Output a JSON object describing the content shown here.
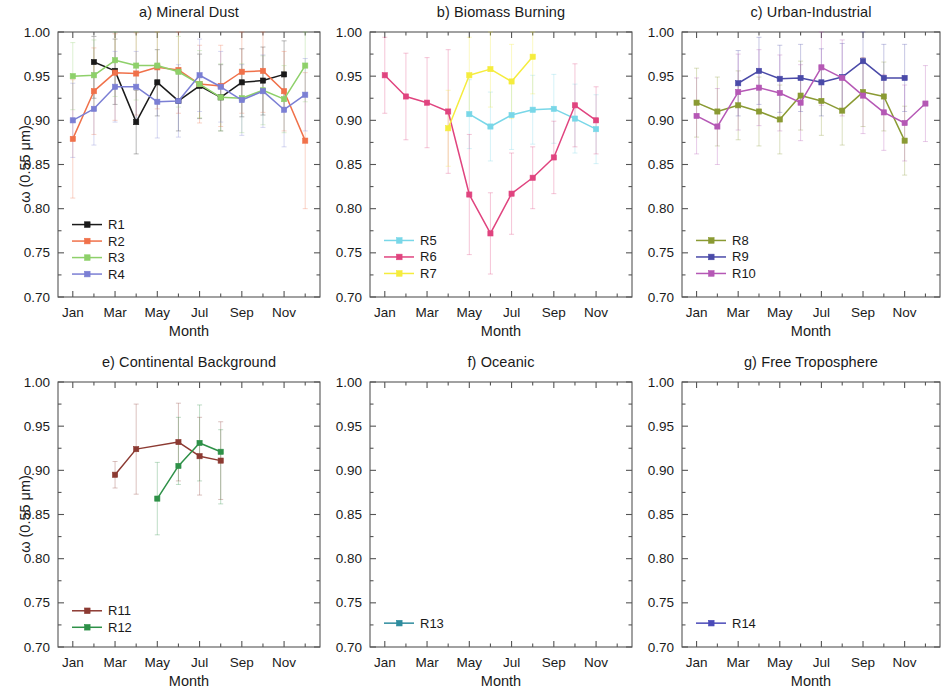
{
  "figure": {
    "width": 946,
    "height": 695,
    "background": "#ffffff"
  },
  "axis": {
    "ylabel": "ω (0.55 μm)",
    "xlabel": "Month",
    "ytick_labels": [
      "1.00",
      "0.95",
      "0.90",
      "0.85",
      "0.80",
      "0.75",
      "0.70"
    ],
    "ytick_values": [
      1.0,
      0.95,
      0.9,
      0.85,
      0.8,
      0.75,
      0.7
    ],
    "xtick_labels": [
      "Jan",
      "Mar",
      "May",
      "Jul",
      "Sep",
      "Nov"
    ],
    "xtick_values": [
      1,
      3,
      5,
      7,
      9,
      11
    ],
    "ylim": [
      0.7,
      1.0
    ],
    "xlim": [
      0.3,
      12.7
    ],
    "minor_ticks": true,
    "grid": false
  },
  "colors": {
    "R1": "#1a1a1a",
    "R2": "#f0714a",
    "R3": "#8ed06a",
    "R4": "#7b7fd4",
    "R5": "#79d7e8",
    "R6": "#e0447f",
    "R7": "#f5ec3d",
    "R8": "#8a9a33",
    "R9": "#4a4aa8",
    "R10": "#b558b5",
    "R11": "#8c3a32",
    "R12": "#2e9148",
    "R13": "#2e8c9e",
    "R14": "#4a4ab8",
    "frame": "#555555",
    "errorbar_opacity": "0.30"
  },
  "chart_data": [
    {
      "id": "a",
      "type": "line",
      "title": "a)  Mineral Dust",
      "xlabel": "Month",
      "ylabel": "ω (0.55 μm)",
      "ylim": [
        0.7,
        1.0
      ],
      "xlim": [
        0.3,
        12.7
      ],
      "categories": [
        "Jan",
        "Mar",
        "May",
        "Jul",
        "Sep",
        "Nov"
      ],
      "legend_position": "lower-left",
      "series": [
        {
          "name": "R1",
          "color": "#1a1a1a",
          "x": [
            2,
            3,
            4,
            5,
            6,
            7,
            8,
            9,
            10,
            11
          ],
          "values": [
            0.966,
            0.956,
            0.898,
            0.943,
            0.922,
            0.939,
            0.926,
            0.943,
            0.945,
            0.952
          ],
          "err_low": [
            0.925,
            0.918,
            0.862,
            0.905,
            0.888,
            0.902,
            0.888,
            0.904,
            0.906,
            0.914
          ],
          "err_high": [
            0.995,
            0.992,
            0.934,
            0.98,
            0.957,
            0.975,
            0.963,
            0.981,
            0.983,
            0.99
          ]
        },
        {
          "name": "R2",
          "color": "#f0714a",
          "x": [
            1,
            2,
            3,
            4,
            5,
            6,
            7,
            8,
            9,
            10,
            11,
            12
          ],
          "values": [
            0.879,
            0.933,
            0.954,
            0.953,
            0.96,
            0.957,
            0.941,
            0.939,
            0.955,
            0.956,
            0.933,
            0.877
          ],
          "err_low": [
            0.812,
            0.884,
            0.9,
            0.906,
            0.913,
            0.908,
            0.897,
            0.893,
            0.908,
            0.909,
            0.888,
            0.8
          ],
          "err_high": [
            0.946,
            0.982,
            0.998,
            0.999,
            1.0,
            1.0,
            0.985,
            0.985,
            1.0,
            1.0,
            0.978,
            0.954
          ]
        },
        {
          "name": "R3",
          "color": "#8ed06a",
          "x": [
            1,
            2,
            3,
            4,
            5,
            6,
            7,
            8,
            9,
            10,
            11,
            12
          ],
          "values": [
            0.95,
            0.951,
            0.968,
            0.962,
            0.962,
            0.955,
            0.941,
            0.926,
            0.925,
            0.934,
            0.924,
            0.962
          ],
          "err_low": [
            0.912,
            0.911,
            0.927,
            0.923,
            0.923,
            0.915,
            0.903,
            0.888,
            0.886,
            0.895,
            0.886,
            0.921
          ],
          "err_high": [
            0.988,
            0.991,
            1.0,
            1.0,
            1.0,
            0.995,
            0.979,
            0.964,
            0.964,
            0.973,
            0.962,
            1.0
          ]
        },
        {
          "name": "R4",
          "color": "#7b7fd4",
          "x": [
            1,
            2,
            3,
            4,
            5,
            6,
            7,
            8,
            9,
            10,
            11,
            12
          ],
          "values": [
            0.9,
            0.913,
            0.938,
            0.938,
            0.921,
            0.922,
            0.951,
            0.938,
            0.923,
            0.933,
            0.912,
            0.929
          ],
          "err_low": [
            0.858,
            0.872,
            0.898,
            0.898,
            0.88,
            0.881,
            0.91,
            0.898,
            0.883,
            0.892,
            0.87,
            0.888
          ],
          "err_high": [
            0.942,
            0.954,
            0.978,
            0.978,
            0.962,
            0.963,
            0.992,
            0.978,
            0.963,
            0.974,
            0.954,
            0.97
          ]
        }
      ]
    },
    {
      "id": "b",
      "type": "line",
      "title": "b) Biomass Burning",
      "xlabel": "Month",
      "ylabel": "",
      "ylim": [
        0.7,
        1.0
      ],
      "xlim": [
        0.3,
        12.7
      ],
      "categories": [
        "Jan",
        "Mar",
        "May",
        "Jul",
        "Sep",
        "Nov"
      ],
      "legend_position": "lower-left",
      "series": [
        {
          "name": "R5",
          "color": "#79d7e8",
          "x": [
            5,
            6,
            7,
            8,
            9,
            10,
            11
          ],
          "values": [
            0.907,
            0.893,
            0.906,
            0.912,
            0.913,
            0.902,
            0.89
          ],
          "err_low": [
            0.868,
            0.854,
            0.867,
            0.873,
            0.874,
            0.863,
            0.851
          ],
          "err_high": [
            0.946,
            0.932,
            0.945,
            0.951,
            0.952,
            0.941,
            0.929
          ]
        },
        {
          "name": "R6",
          "color": "#e0447f",
          "x": [
            1,
            2,
            3,
            4,
            5,
            6,
            7,
            8,
            9,
            10,
            11
          ],
          "values": [
            0.951,
            0.927,
            0.92,
            0.91,
            0.816,
            0.772,
            0.817,
            0.835,
            0.858,
            0.917,
            0.9
          ],
          "err_low": [
            0.908,
            0.878,
            0.869,
            0.84,
            0.748,
            0.726,
            0.771,
            0.8,
            0.817,
            0.87,
            0.862
          ],
          "err_high": [
            0.994,
            0.976,
            0.971,
            0.98,
            0.884,
            0.818,
            0.863,
            0.87,
            0.899,
            0.964,
            0.938
          ]
        },
        {
          "name": "R7",
          "color": "#f5ec3d",
          "x": [
            4,
            5,
            6,
            7,
            8
          ],
          "values": [
            0.891,
            0.951,
            0.958,
            0.944,
            0.972
          ],
          "err_low": [
            0.848,
            0.908,
            0.915,
            0.902,
            0.93
          ],
          "err_high": [
            0.934,
            0.994,
            1.0,
            0.986,
            1.0
          ]
        }
      ]
    },
    {
      "id": "c",
      "type": "line",
      "title": "c) Urban-Industrial",
      "xlabel": "Month",
      "ylabel": "",
      "ylim": [
        0.7,
        1.0
      ],
      "xlim": [
        0.3,
        12.7
      ],
      "categories": [
        "Jan",
        "Mar",
        "May",
        "Jul",
        "Sep",
        "Nov"
      ],
      "legend_position": "lower-left",
      "series": [
        {
          "name": "R8",
          "color": "#8a9a33",
          "x": [
            1,
            2,
            3,
            4,
            5,
            6,
            7,
            8,
            9,
            10,
            11
          ],
          "values": [
            0.92,
            0.91,
            0.917,
            0.91,
            0.901,
            0.928,
            0.922,
            0.911,
            0.932,
            0.927,
            0.877
          ],
          "err_low": [
            0.881,
            0.871,
            0.878,
            0.871,
            0.862,
            0.889,
            0.883,
            0.872,
            0.893,
            0.888,
            0.838
          ],
          "err_high": [
            0.959,
            0.949,
            0.956,
            0.949,
            0.94,
            0.967,
            0.961,
            0.95,
            0.971,
            0.966,
            0.916
          ]
        },
        {
          "name": "R9",
          "color": "#4a4aa8",
          "x": [
            3,
            4,
            5,
            6,
            7,
            8,
            9,
            10,
            11
          ],
          "values": [
            0.942,
            0.956,
            0.947,
            0.948,
            0.943,
            0.949,
            0.967,
            0.948,
            0.948
          ],
          "err_low": [
            0.905,
            0.918,
            0.909,
            0.91,
            0.905,
            0.911,
            0.929,
            0.91,
            0.91
          ],
          "err_high": [
            0.979,
            0.994,
            0.985,
            0.986,
            0.981,
            0.987,
            1.0,
            0.986,
            0.986
          ]
        },
        {
          "name": "R10",
          "color": "#b558b5",
          "x": [
            1,
            2,
            3,
            4,
            5,
            6,
            7,
            8,
            9,
            10,
            11,
            12
          ],
          "values": [
            0.905,
            0.893,
            0.932,
            0.937,
            0.931,
            0.92,
            0.96,
            0.948,
            0.928,
            0.909,
            0.897,
            0.919
          ],
          "err_low": [
            0.862,
            0.85,
            0.889,
            0.894,
            0.888,
            0.877,
            0.917,
            0.905,
            0.885,
            0.866,
            0.854,
            0.876
          ],
          "err_high": [
            0.948,
            0.936,
            0.975,
            0.98,
            0.974,
            0.963,
            1.0,
            0.991,
            0.971,
            0.952,
            0.94,
            0.962
          ]
        }
      ]
    },
    {
      "id": "e",
      "type": "line",
      "title": "e) Continental Background",
      "xlabel": "Month",
      "ylabel": "ω (0.55 μm)",
      "ylim": [
        0.7,
        1.0
      ],
      "xlim": [
        0.3,
        12.7
      ],
      "categories": [
        "Jan",
        "Mar",
        "May",
        "Jul",
        "Sep",
        "Nov"
      ],
      "legend_position": "lower-left",
      "series": [
        {
          "name": "R11",
          "color": "#8c3a32",
          "x": [
            3,
            4,
            6,
            7,
            8
          ],
          "values": [
            0.895,
            0.924,
            0.932,
            0.916,
            0.911
          ],
          "err_low": [
            0.88,
            0.873,
            0.888,
            0.872,
            0.867
          ],
          "err_high": [
            0.91,
            0.975,
            0.976,
            0.96,
            0.955
          ]
        },
        {
          "name": "R12",
          "color": "#2e9148",
          "x": [
            5,
            6,
            7,
            8
          ],
          "values": [
            0.868,
            0.905,
            0.931,
            0.921
          ],
          "err_low": [
            0.827,
            0.884,
            0.888,
            0.862
          ],
          "err_high": [
            0.909,
            0.96,
            0.974,
            0.946
          ]
        }
      ]
    },
    {
      "id": "f",
      "type": "line",
      "title": "f) Oceanic",
      "xlabel": "Month",
      "ylabel": "",
      "ylim": [
        0.7,
        1.0
      ],
      "xlim": [
        0.3,
        12.7
      ],
      "categories": [
        "Jan",
        "Mar",
        "May",
        "Jul",
        "Sep",
        "Nov"
      ],
      "legend_position": "lower-left",
      "series": [
        {
          "name": "R13",
          "color": "#2e8c9e",
          "x": [],
          "values": [],
          "err_low": [],
          "err_high": []
        }
      ]
    },
    {
      "id": "g",
      "type": "line",
      "title": "g) Free Troposphere",
      "xlabel": "Month",
      "ylabel": "",
      "ylim": [
        0.7,
        1.0
      ],
      "xlim": [
        0.3,
        12.7
      ],
      "categories": [
        "Jan",
        "Mar",
        "May",
        "Jul",
        "Sep",
        "Nov"
      ],
      "legend_position": "lower-left",
      "series": [
        {
          "name": "R14",
          "color": "#4a4ab8",
          "x": [],
          "values": [],
          "err_low": [],
          "err_high": []
        }
      ]
    }
  ],
  "layout": {
    "panels": [
      {
        "id": "a",
        "left": 0,
        "top": 4,
        "plot_x": 58,
        "plot_y": 28,
        "plot_w": 262,
        "plot_h": 265,
        "show_ylabel": true,
        "legend_y_start": 0.782
      },
      {
        "id": "b",
        "left": 312,
        "top": 4,
        "plot_x": 58,
        "plot_y": 28,
        "plot_w": 262,
        "plot_h": 265,
        "show_ylabel": false,
        "legend_y_start": 0.764
      },
      {
        "id": "c",
        "left": 624,
        "top": 4,
        "plot_x": 58,
        "plot_y": 28,
        "plot_w": 258,
        "plot_h": 265,
        "show_ylabel": false,
        "legend_y_start": 0.764
      },
      {
        "id": "e",
        "left": 0,
        "top": 354,
        "plot_x": 58,
        "plot_y": 28,
        "plot_w": 262,
        "plot_h": 265,
        "show_ylabel": true,
        "legend_y_start": 0.741
      },
      {
        "id": "f",
        "left": 312,
        "top": 354,
        "plot_x": 58,
        "plot_y": 28,
        "plot_w": 262,
        "plot_h": 265,
        "show_ylabel": false,
        "legend_y_start": 0.727
      },
      {
        "id": "g",
        "left": 624,
        "top": 354,
        "plot_x": 58,
        "plot_y": 28,
        "plot_w": 258,
        "plot_h": 265,
        "show_ylabel": false,
        "legend_y_start": 0.727
      }
    ]
  }
}
